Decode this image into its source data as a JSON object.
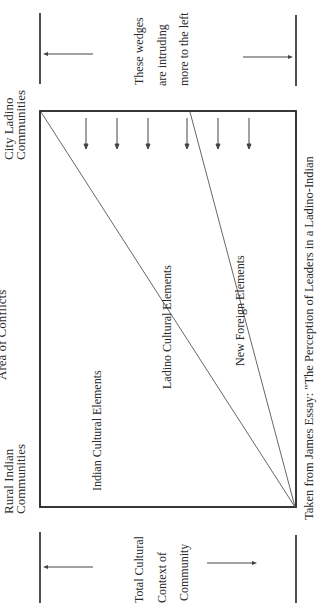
{
  "diagram": {
    "top_note": {
      "lines": [
        "These wedges",
        "are intruding",
        "more to the left"
      ]
    },
    "bottom_note": {
      "lines": [
        "Total Cultural",
        "Context of",
        "Community"
      ]
    },
    "side_labels": {
      "city": [
        "City Ladino",
        "Communities"
      ],
      "conflict": "Area of Conflicts",
      "rural": [
        "Rural Indian",
        "Communities"
      ]
    },
    "regions": {
      "indian": "Indian Cultural Elements",
      "ladino": "Ladino Cultural Elements",
      "foreign": "New Foreign Elements"
    },
    "caption": "Taken from James Essay: \"The Perception of Leaders in a Ladino-Indian",
    "colors": {
      "ink": "#222222",
      "line": "#555555",
      "background": "#ffffff"
    }
  }
}
